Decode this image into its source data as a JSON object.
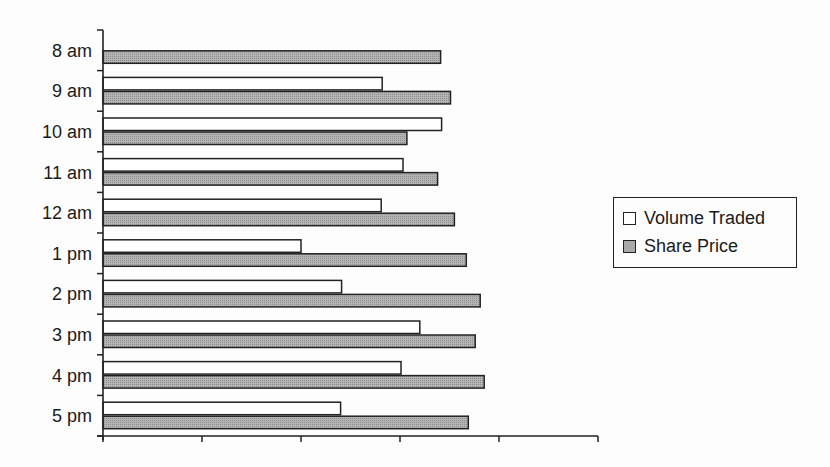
{
  "chart_data": {
    "type": "bar",
    "orientation": "horizontal",
    "title": "",
    "xlabel": "",
    "ylabel": "",
    "categories": [
      "8 am",
      "9 am",
      "10 am",
      "11 am",
      "12 am",
      "1 pm",
      "2 pm",
      "3 pm",
      "4 pm",
      "5 pm"
    ],
    "series": [
      {
        "name": "Volume Traded",
        "color": "#ffffff",
        "values": [
          0,
          2.82,
          3.42,
          3.03,
          2.81,
          2.0,
          2.41,
          3.2,
          3.01,
          2.4
        ]
      },
      {
        "name": "Share Price",
        "color": "#a9a9a9",
        "values": [
          3.41,
          3.51,
          3.07,
          3.38,
          3.55,
          3.67,
          3.81,
          3.76,
          3.85,
          3.69
        ]
      }
    ],
    "xlim": [
      0,
      5
    ],
    "x_ticks": 6,
    "x_tick_labels": [],
    "grid": false,
    "legend_position": "right"
  },
  "legend": {
    "items": [
      {
        "label": "Volume Traded",
        "color": "#ffffff"
      },
      {
        "label": "Share Price",
        "color": "#a9a9a9"
      }
    ]
  }
}
